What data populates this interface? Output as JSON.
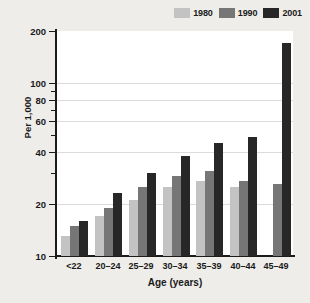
{
  "chart_data": {
    "type": "bar",
    "title": "",
    "subtitle": "",
    "xlabel": "Age (years)",
    "ylabel": "Per 1,000",
    "categories": [
      "<22",
      "20–24",
      "25–29",
      "30–34",
      "35–39",
      "40–44",
      "45–49"
    ],
    "series": [
      {
        "name": "1980",
        "color": "#c3c3c3",
        "values": [
          13,
          17,
          21,
          25,
          27,
          25,
          null
        ]
      },
      {
        "name": "1990",
        "color": "#767676",
        "values": [
          15,
          19,
          25,
          29,
          31,
          27,
          26
        ]
      },
      {
        "name": "2001",
        "color": "#272727",
        "values": [
          16,
          23,
          30,
          38,
          45,
          49,
          170
        ]
      }
    ],
    "yscale": "log",
    "ylim": [
      10,
      200
    ],
    "ytick_labels": [
      "200",
      "100",
      "80",
      "60",
      "40",
      "20",
      "10"
    ],
    "ytick_values": [
      200,
      100,
      80,
      60,
      40,
      20,
      10
    ],
    "yminor_ticks": [
      90,
      70,
      50,
      30
    ],
    "gridlines": [
      100,
      80,
      60,
      40,
      20
    ],
    "grid": true,
    "legend": {
      "position": "top-right",
      "entries": [
        {
          "label": "1980",
          "color": "#c3c3c3"
        },
        {
          "label": "1990",
          "color": "#767676"
        },
        {
          "label": "2001",
          "color": "#272727"
        }
      ]
    },
    "colors": {
      "page_background": "#efedea",
      "plot_background": "#ffffff",
      "axis": "#1b1b1b",
      "gridline": "#dcdcdc",
      "text": "#1a1a1a"
    }
  }
}
